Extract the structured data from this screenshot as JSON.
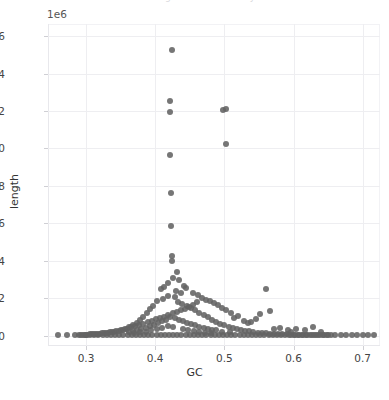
{
  "figure": {
    "clipped_title": "length  distribution  by  GC",
    "background_color": "#ffffff",
    "point_color": "#636363",
    "grid_color": "#eeeef1",
    "axis_text_color": "#444444"
  },
  "chart_data": {
    "type": "scatter",
    "title": "",
    "xlabel": "GC",
    "ylabel": "length",
    "y_offset_text": "1e6",
    "y_offset_multiplier": 1000000,
    "xlim": [
      0.245,
      0.725
    ],
    "ylim": [
      -0.055,
      1.665
    ],
    "grid": true,
    "legend": null,
    "marker": "circle",
    "marker_size": 6,
    "xticks": [
      0.3,
      0.4,
      0.5,
      0.6,
      0.7
    ],
    "xtick_labels": [
      "0.3",
      "0.4",
      "0.5",
      "0.6",
      "0.7"
    ],
    "yticks": [
      0.0,
      0.2,
      0.4,
      0.6,
      0.8,
      1.0,
      1.2,
      1.4,
      1.6
    ],
    "ytick_labels": [
      "0.0",
      "0.2",
      "0.4",
      "0.6",
      "0.8",
      "1.0",
      "1.2",
      "1.4",
      "1.6"
    ],
    "points": [
      [
        0.424,
        1.525
      ],
      [
        0.421,
        1.255
      ],
      [
        0.421,
        1.195
      ],
      [
        0.498,
        1.205
      ],
      [
        0.503,
        1.212
      ],
      [
        0.502,
        1.022
      ],
      [
        0.422,
        0.965
      ],
      [
        0.423,
        0.76
      ],
      [
        0.423,
        0.585
      ],
      [
        0.424,
        0.425
      ],
      [
        0.424,
        0.4
      ],
      [
        0.431,
        0.34
      ],
      [
        0.426,
        0.31
      ],
      [
        0.435,
        0.3
      ],
      [
        0.441,
        0.268
      ],
      [
        0.418,
        0.282
      ],
      [
        0.413,
        0.262
      ],
      [
        0.408,
        0.248
      ],
      [
        0.445,
        0.255
      ],
      [
        0.455,
        0.23
      ],
      [
        0.462,
        0.215
      ],
      [
        0.437,
        0.228
      ],
      [
        0.43,
        0.24
      ],
      [
        0.428,
        0.205
      ],
      [
        0.419,
        0.212
      ],
      [
        0.411,
        0.196
      ],
      [
        0.403,
        0.188
      ],
      [
        0.397,
        0.16
      ],
      [
        0.392,
        0.145
      ],
      [
        0.388,
        0.12
      ],
      [
        0.383,
        0.1
      ],
      [
        0.378,
        0.085
      ],
      [
        0.373,
        0.07
      ],
      [
        0.368,
        0.058
      ],
      [
        0.362,
        0.046
      ],
      [
        0.356,
        0.038
      ],
      [
        0.35,
        0.03
      ],
      [
        0.344,
        0.024
      ],
      [
        0.338,
        0.02
      ],
      [
        0.332,
        0.016
      ],
      [
        0.326,
        0.013
      ],
      [
        0.32,
        0.01
      ],
      [
        0.314,
        0.008
      ],
      [
        0.308,
        0.007
      ],
      [
        0.302,
        0.006
      ],
      [
        0.433,
        0.178
      ],
      [
        0.439,
        0.168
      ],
      [
        0.446,
        0.158
      ],
      [
        0.452,
        0.148
      ],
      [
        0.458,
        0.135
      ],
      [
        0.464,
        0.122
      ],
      [
        0.47,
        0.11
      ],
      [
        0.476,
        0.098
      ],
      [
        0.482,
        0.086
      ],
      [
        0.488,
        0.074
      ],
      [
        0.494,
        0.064
      ],
      [
        0.5,
        0.055
      ],
      [
        0.506,
        0.048
      ],
      [
        0.512,
        0.042
      ],
      [
        0.518,
        0.036
      ],
      [
        0.524,
        0.031
      ],
      [
        0.53,
        0.027
      ],
      [
        0.536,
        0.023
      ],
      [
        0.542,
        0.02
      ],
      [
        0.548,
        0.017
      ],
      [
        0.554,
        0.015
      ],
      [
        0.56,
        0.013
      ],
      [
        0.566,
        0.011
      ],
      [
        0.572,
        0.01
      ],
      [
        0.578,
        0.009
      ],
      [
        0.584,
        0.008
      ],
      [
        0.59,
        0.007
      ],
      [
        0.596,
        0.006
      ],
      [
        0.602,
        0.006
      ],
      [
        0.608,
        0.005
      ],
      [
        0.614,
        0.005
      ],
      [
        0.62,
        0.004
      ],
      [
        0.626,
        0.004
      ],
      [
        0.632,
        0.003
      ],
      [
        0.638,
        0.003
      ],
      [
        0.644,
        0.003
      ],
      [
        0.65,
        0.002
      ],
      [
        0.56,
        0.248
      ],
      [
        0.566,
        0.13
      ],
      [
        0.552,
        0.118
      ],
      [
        0.545,
        0.09
      ],
      [
        0.539,
        0.074
      ],
      [
        0.52,
        0.105
      ],
      [
        0.514,
        0.092
      ],
      [
        0.528,
        0.08
      ],
      [
        0.534,
        0.068
      ],
      [
        0.509,
        0.122
      ],
      [
        0.503,
        0.138
      ],
      [
        0.497,
        0.15
      ],
      [
        0.491,
        0.165
      ],
      [
        0.485,
        0.175
      ],
      [
        0.479,
        0.185
      ],
      [
        0.473,
        0.192
      ],
      [
        0.467,
        0.2
      ],
      [
        0.461,
        0.178
      ],
      [
        0.455,
        0.165
      ],
      [
        0.449,
        0.155
      ],
      [
        0.443,
        0.145
      ],
      [
        0.437,
        0.138
      ],
      [
        0.431,
        0.128
      ],
      [
        0.425,
        0.12
      ],
      [
        0.419,
        0.112
      ],
      [
        0.413,
        0.102
      ],
      [
        0.407,
        0.095
      ],
      [
        0.401,
        0.088
      ],
      [
        0.395,
        0.08
      ],
      [
        0.389,
        0.072
      ],
      [
        0.383,
        0.065
      ],
      [
        0.377,
        0.058
      ],
      [
        0.371,
        0.05
      ],
      [
        0.365,
        0.044
      ],
      [
        0.359,
        0.038
      ],
      [
        0.353,
        0.032
      ],
      [
        0.347,
        0.027
      ],
      [
        0.341,
        0.022
      ],
      [
        0.335,
        0.018
      ],
      [
        0.329,
        0.014
      ],
      [
        0.323,
        0.012
      ],
      [
        0.317,
        0.01
      ],
      [
        0.311,
        0.008
      ],
      [
        0.305,
        0.007
      ],
      [
        0.299,
        0.006
      ],
      [
        0.293,
        0.005
      ],
      [
        0.428,
        0.092
      ],
      [
        0.434,
        0.085
      ],
      [
        0.44,
        0.078
      ],
      [
        0.446,
        0.07
      ],
      [
        0.452,
        0.062
      ],
      [
        0.458,
        0.055
      ],
      [
        0.464,
        0.048
      ],
      [
        0.47,
        0.042
      ],
      [
        0.476,
        0.036
      ],
      [
        0.482,
        0.032
      ],
      [
        0.488,
        0.028
      ],
      [
        0.422,
        0.098
      ],
      [
        0.416,
        0.086
      ],
      [
        0.41,
        0.076
      ],
      [
        0.404,
        0.066
      ],
      [
        0.398,
        0.058
      ],
      [
        0.392,
        0.05
      ],
      [
        0.386,
        0.042
      ],
      [
        0.38,
        0.036
      ],
      [
        0.374,
        0.03
      ],
      [
        0.368,
        0.025
      ],
      [
        0.362,
        0.02
      ],
      [
        0.26,
        0.002
      ],
      [
        0.272,
        0.002
      ],
      [
        0.284,
        0.002
      ],
      [
        0.29,
        0.002
      ],
      [
        0.296,
        0.002
      ],
      [
        0.3,
        0.002
      ],
      [
        0.306,
        0.002
      ],
      [
        0.312,
        0.002
      ],
      [
        0.318,
        0.002
      ],
      [
        0.324,
        0.002
      ],
      [
        0.33,
        0.002
      ],
      [
        0.336,
        0.002
      ],
      [
        0.342,
        0.002
      ],
      [
        0.348,
        0.002
      ],
      [
        0.354,
        0.002
      ],
      [
        0.36,
        0.002
      ],
      [
        0.366,
        0.002
      ],
      [
        0.372,
        0.002
      ],
      [
        0.378,
        0.002
      ],
      [
        0.384,
        0.002
      ],
      [
        0.39,
        0.002
      ],
      [
        0.396,
        0.002
      ],
      [
        0.402,
        0.002
      ],
      [
        0.408,
        0.002
      ],
      [
        0.414,
        0.002
      ],
      [
        0.42,
        0.002
      ],
      [
        0.426,
        0.002
      ],
      [
        0.432,
        0.002
      ],
      [
        0.438,
        0.002
      ],
      [
        0.444,
        0.002
      ],
      [
        0.45,
        0.002
      ],
      [
        0.456,
        0.002
      ],
      [
        0.462,
        0.002
      ],
      [
        0.468,
        0.002
      ],
      [
        0.474,
        0.002
      ],
      [
        0.48,
        0.002
      ],
      [
        0.486,
        0.002
      ],
      [
        0.492,
        0.002
      ],
      [
        0.498,
        0.002
      ],
      [
        0.504,
        0.002
      ],
      [
        0.51,
        0.002
      ],
      [
        0.516,
        0.002
      ],
      [
        0.522,
        0.002
      ],
      [
        0.528,
        0.002
      ],
      [
        0.534,
        0.002
      ],
      [
        0.54,
        0.002
      ],
      [
        0.546,
        0.002
      ],
      [
        0.552,
        0.002
      ],
      [
        0.558,
        0.002
      ],
      [
        0.564,
        0.002
      ],
      [
        0.57,
        0.002
      ],
      [
        0.576,
        0.002
      ],
      [
        0.582,
        0.002
      ],
      [
        0.588,
        0.002
      ],
      [
        0.594,
        0.002
      ],
      [
        0.6,
        0.002
      ],
      [
        0.606,
        0.002
      ],
      [
        0.612,
        0.002
      ],
      [
        0.618,
        0.002
      ],
      [
        0.624,
        0.002
      ],
      [
        0.63,
        0.002
      ],
      [
        0.636,
        0.002
      ],
      [
        0.642,
        0.002
      ],
      [
        0.648,
        0.002
      ],
      [
        0.654,
        0.002
      ],
      [
        0.66,
        0.002
      ],
      [
        0.668,
        0.002
      ],
      [
        0.676,
        0.002
      ],
      [
        0.684,
        0.002
      ],
      [
        0.692,
        0.002
      ],
      [
        0.7,
        0.002
      ],
      [
        0.708,
        0.002
      ],
      [
        0.716,
        0.002
      ],
      [
        0.44,
        0.038
      ],
      [
        0.448,
        0.03
      ],
      [
        0.456,
        0.024
      ],
      [
        0.464,
        0.02
      ],
      [
        0.472,
        0.016
      ],
      [
        0.48,
        0.013
      ],
      [
        0.496,
        0.022
      ],
      [
        0.508,
        0.018
      ],
      [
        0.426,
        0.045
      ],
      [
        0.418,
        0.052
      ],
      [
        0.41,
        0.04
      ],
      [
        0.402,
        0.034
      ],
      [
        0.394,
        0.028
      ],
      [
        0.386,
        0.022
      ],
      [
        0.378,
        0.018
      ],
      [
        0.37,
        0.014
      ],
      [
        0.628,
        0.045
      ],
      [
        0.64,
        0.022
      ],
      [
        0.616,
        0.03
      ],
      [
        0.604,
        0.038
      ],
      [
        0.592,
        0.028
      ],
      [
        0.58,
        0.042
      ],
      [
        0.572,
        0.035
      ],
      [
        0.596,
        0.018
      ]
    ]
  }
}
